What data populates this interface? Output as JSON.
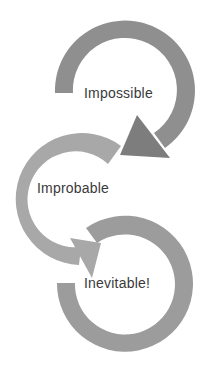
{
  "diagram": {
    "type": "cycle-arrows",
    "stages": [
      {
        "label": "Impossible",
        "color": "#8f8f8f",
        "arrowhead_color": "#7d7d7d"
      },
      {
        "label": "Improbable",
        "color": "#a8a8a8",
        "arrowhead_color": "#a8a8a8"
      },
      {
        "label": "Inevitable!",
        "color": "#9c9c9c",
        "arrowhead_color": "#9c9c9c"
      }
    ],
    "text_color": "#3a3a3a",
    "background": "#ffffff"
  }
}
